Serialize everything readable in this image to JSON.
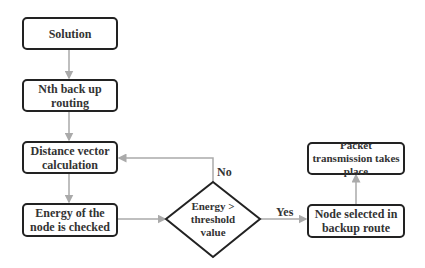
{
  "nodes": {
    "solution": "Solution",
    "nth_backup": "Nth back up routing",
    "distance_vector": "Distance vector calculation",
    "energy_checked": "Energy of the node is checked",
    "decision": "Energy > threshold value",
    "node_selected": "Node selected in backup route",
    "packet_transmission": "Packet transmission takes place"
  },
  "edges": {
    "no_label": "No",
    "yes_label": "Yes"
  },
  "colors": {
    "border": "#222222",
    "arrow": "#aaaaaa",
    "text": "#333333"
  }
}
